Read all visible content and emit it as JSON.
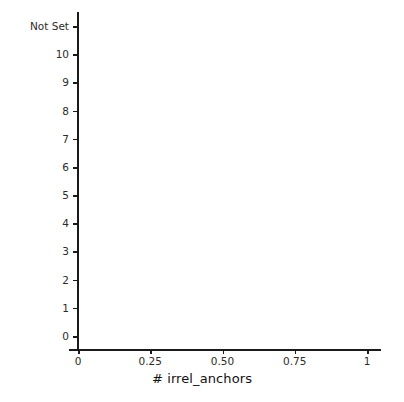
{
  "chart_data": {
    "type": "bar",
    "orientation": "horizontal",
    "title": "",
    "xlabel": "# irrel_anchors",
    "ylabel": "",
    "xlim": [
      0,
      1.07
    ],
    "xticks": [
      0,
      0.25,
      0.5,
      0.75,
      1
    ],
    "xticklabels": [
      "0",
      "0.25",
      "0.50",
      "0.75",
      "1"
    ],
    "grid": false,
    "legend": null,
    "bar_color": "#4a4a4a",
    "background_color": "#ffffff",
    "axis_color": "#1a1a1a",
    "categories": [
      "Not Set",
      "10",
      "9",
      "8",
      "7",
      "6",
      "5",
      "4",
      "3",
      "2",
      "1",
      "0"
    ],
    "values": [
      0.98,
      1.0,
      1.0,
      1.0,
      0.99,
      0.98,
      0.935,
      0.865,
      0.59,
      0.805,
      0.98,
      1.0
    ],
    "bars": [
      {
        "category": "Not Set",
        "value": 0.98
      },
      {
        "category": "10",
        "value": 1.0
      },
      {
        "category": "9",
        "value": 1.0
      },
      {
        "category": "8",
        "value": 1.0
      },
      {
        "category": "7",
        "value": 0.99
      },
      {
        "category": "6",
        "value": 0.98
      },
      {
        "category": "5",
        "value": 0.935
      },
      {
        "category": "4",
        "value": 0.865
      },
      {
        "category": "3",
        "value": 0.59
      },
      {
        "category": "2",
        "value": 0.805
      },
      {
        "category": "1",
        "value": 0.98
      },
      {
        "category": "0",
        "value": 1.0
      }
    ]
  }
}
